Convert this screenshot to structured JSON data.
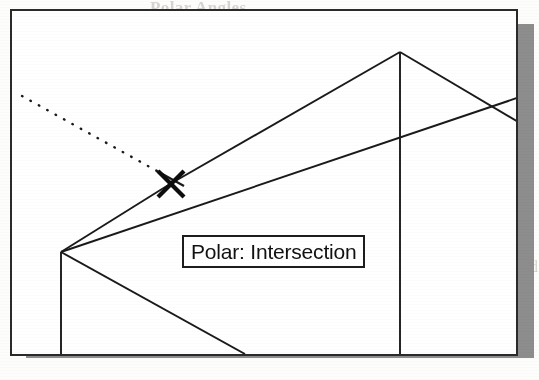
{
  "viewport": {
    "name": "cad-drawing-viewport",
    "background_color": "#ffffff",
    "border_color": "#2a2a2a",
    "shadow_color": "#8d8d8d"
  },
  "tooltip": {
    "label": "Polar: Intersection",
    "background_color": "#ffffff",
    "border_color": "#1d1d1d",
    "text_color": "#111111"
  },
  "drawing": {
    "line_color": "#1a1a1a",
    "tracking_line_style": "dotted",
    "marker": {
      "type": "intersection-marker",
      "glyph": "X",
      "x": 168,
      "y": 182
    },
    "geometry_note": "3D wireframe of a pitched-roof solid in isometric view"
  },
  "ghost_text": [
    {
      "text": "Polar Angles",
      "x": 150,
      "y": -2,
      "size": 17,
      "weight": "bold"
    },
    {
      "text": "nple: Drawing with Polar Tracking",
      "x": 120,
      "y": 42,
      "size": 16
    },
    {
      "text": "Choose Tools > Drafting Settings.",
      "x": 118,
      "y": 92,
      "size": 16
    },
    {
      "text": "Polar Tracking tab, the Polar",
      "x": 300,
      "y": 92,
      "size": 16
    },
    {
      "text": "ment Angle, type 22.5.",
      "x": 122,
      "y": 138,
      "size": 16
    },
    {
      "text": "Additional angles check box, then",
      "x": 300,
      "y": 138,
      "size": 16
    },
    {
      "text": "Increment angle area, the New",
      "x": 118,
      "y": 258,
      "size": 16
    },
    {
      "text": "button is displayed. Click New and",
      "x": 300,
      "y": 258,
      "size": 16
    },
    {
      "text": "dditional angle.",
      "x": 122,
      "y": 292,
      "size": 16
    },
    {
      "text": "Click OK.",
      "x": 300,
      "y": 292,
      "size": 16
    },
    {
      "text": "ar tracking is on.",
      "x": 122,
      "y": 330,
      "size": 16
    },
    {
      "text": "the line.",
      "x": 330,
      "y": 330,
      "size": 16
    }
  ]
}
